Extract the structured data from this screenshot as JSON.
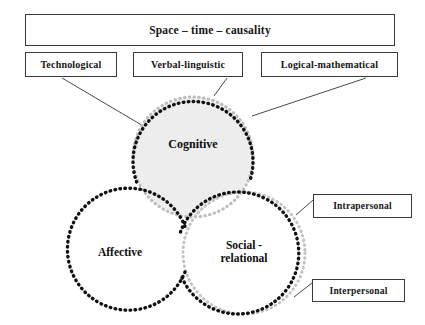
{
  "diagram": {
    "title": "Space – time – causality",
    "top_boxes": [
      {
        "label": "Technological"
      },
      {
        "label": "Verbal-linguistic"
      },
      {
        "label": "Logical-mathematical"
      }
    ],
    "side_boxes": [
      {
        "label": "Intrapersonal"
      },
      {
        "label": "Interpersonal"
      }
    ],
    "circles": [
      {
        "label": "Cognitive",
        "cx": 193,
        "cy": 157,
        "r": 60,
        "fill": "#ededed"
      },
      {
        "label": "Affective",
        "cx": 120,
        "cy": 253,
        "r": 61,
        "fill": "#ffffff"
      },
      {
        "label": "Social -\nrelational",
        "cx": 244,
        "cy": 253,
        "r": 61,
        "fill": "#ffffff"
      }
    ],
    "colors": {
      "background": "#ffffff",
      "box_border": "#3a3a3a",
      "text": "#151515",
      "circle_dots": "#111111",
      "circle_dots_light": "#b9b9b9",
      "circle_fill_cognitive": "#ededed",
      "leader_line": "#4a4a4a"
    }
  }
}
